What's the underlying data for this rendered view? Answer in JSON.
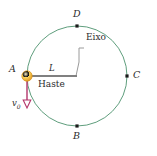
{
  "figure": {
    "background_color": "#ffffff",
    "canvas": {
      "width": 157,
      "height": 156
    },
    "circle": {
      "name": "trajectory-circle",
      "center_x": 77,
      "center_y": 76,
      "radius": 50,
      "stroke_color": "#5f9e7d",
      "stroke_width": 1
    },
    "points": [
      {
        "id": "A",
        "label": "A",
        "x": 27,
        "y": 76,
        "marker": "ball",
        "label_x": 9,
        "label_y": 64
      },
      {
        "id": "B",
        "label": "B",
        "x": 77,
        "y": 126,
        "marker": "square",
        "label_x": 74,
        "label_y": 131
      },
      {
        "id": "C",
        "label": "C",
        "x": 127,
        "y": 76,
        "marker": "square",
        "label_x": 132,
        "label_y": 71
      },
      {
        "id": "D",
        "label": "D",
        "x": 77,
        "y": 26,
        "marker": "square",
        "label_x": 74,
        "label_y": 11
      }
    ],
    "rod": {
      "name": "rod-haste",
      "label": "Haste",
      "length_label": "L",
      "x1": 27,
      "y1": 76,
      "x2": 77,
      "y2": 76,
      "stroke_color": "#808080",
      "stroke_width": 2.2,
      "length_label_x": 50,
      "length_label_y": 66,
      "label_x": 40,
      "label_y": 80
    },
    "axis": {
      "name": "axis-eixo",
      "label": "Eixo",
      "label_x": 86,
      "label_y": 38,
      "leader_points": "84,48 79,48 79,62 76,76",
      "stroke_color": "#9a9a9a",
      "stroke_width": 1
    },
    "velocity": {
      "name": "velocity-vector",
      "label": "v",
      "subscript": "0",
      "x1": 27,
      "y1": 79,
      "x2": 27,
      "y2": 106,
      "stroke_color": "#b3356b",
      "stroke_width": 1.4,
      "arrowhead_fill": "#ffffff",
      "label_x": 13,
      "label_y": 104
    },
    "ball": {
      "name": "mass-ball-a",
      "cx": 27,
      "cy": 76,
      "r": 5.2,
      "fill_center": "#ffe9a0",
      "fill_mid": "#f7c84a",
      "fill_edge": "#e8a42c",
      "stroke_color": "#d6931f"
    },
    "marker": {
      "size": 3.2,
      "color": "#1a1a1a"
    }
  }
}
